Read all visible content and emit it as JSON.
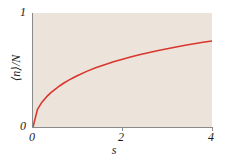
{
  "figure": {
    "background_color": "#ffffff",
    "plot_background_color": "#ece3da",
    "axis_color": "#8a8a8a"
  },
  "axes": {
    "x_title": "s",
    "y_title": "⟨n⟩/N",
    "x_ticks": [
      {
        "value": 0,
        "label": "0"
      },
      {
        "value": 2,
        "label": "2"
      },
      {
        "value": 4,
        "label": "4"
      }
    ],
    "y_ticks": [
      {
        "value": 0,
        "label": "0"
      },
      {
        "value": 1,
        "label": "1"
      }
    ]
  },
  "chart_data": {
    "type": "line",
    "title": "",
    "subtitle": "",
    "xlabel": "s",
    "ylabel": "⟨n⟩/N",
    "xlim": [
      0,
      4
    ],
    "ylim": [
      0,
      1
    ],
    "xticks": [
      0,
      2,
      4
    ],
    "yticks": [
      0,
      1
    ],
    "grid": false,
    "legend": null,
    "legend_position": "none",
    "annotations": [],
    "series": [
      {
        "name": "⟨n⟩/N",
        "color": "#d9372e",
        "line_width": 1.6,
        "x": [
          0,
          0.1,
          0.2,
          0.3,
          0.4,
          0.5,
          0.6,
          0.7,
          0.8,
          0.9,
          1.0,
          1.2,
          1.4,
          1.6,
          1.8,
          2.0,
          2.2,
          2.4,
          2.6,
          2.8,
          3.0,
          3.2,
          3.4,
          3.6,
          3.8,
          4.0
        ],
        "y": [
          0.0,
          0.155,
          0.218,
          0.264,
          0.301,
          0.333,
          0.362,
          0.388,
          0.411,
          0.432,
          0.452,
          0.488,
          0.519,
          0.547,
          0.572,
          0.595,
          0.616,
          0.636,
          0.654,
          0.671,
          0.687,
          0.702,
          0.717,
          0.73,
          0.743,
          0.755
        ]
      }
    ]
  }
}
